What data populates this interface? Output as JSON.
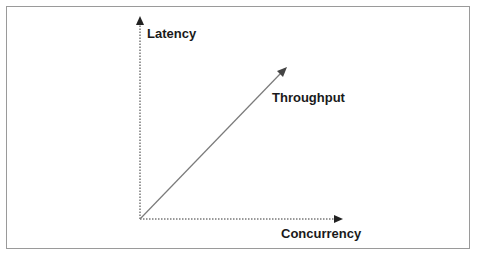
{
  "diagram": {
    "y_axis_label": "Latency",
    "x_axis_label": "Concurrency",
    "trend_label": "Throughput",
    "colors": {
      "axis": "#333333",
      "trend": "#7a7a7a",
      "arrowhead": "#222222",
      "frame": "#9a9a9a",
      "text": "#1a1a1a"
    }
  }
}
